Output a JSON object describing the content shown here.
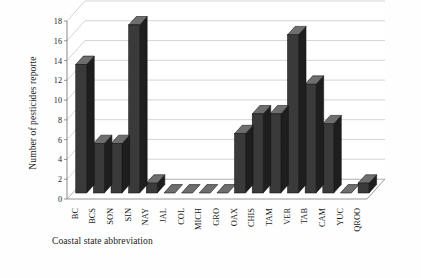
{
  "chart_data": {
    "type": "bar",
    "title": "",
    "subtitle": "",
    "xlabel": "Coastal state abbreviation",
    "ylabel": "Number of pesticides reporte",
    "categories": [
      "BC",
      "BCS",
      "SON",
      "SIN",
      "NAY",
      "JAL",
      "COL",
      "MICH",
      "GRO",
      "OAX",
      "CHIS",
      "TAM",
      "VER",
      "TAB",
      "CAM",
      "YUC",
      "QROO"
    ],
    "values": [
      13,
      5,
      5,
      17,
      1,
      0,
      0,
      0,
      0,
      6,
      8,
      8,
      16,
      11,
      7,
      0,
      1
    ],
    "ylim": [
      0,
      18
    ],
    "yticks": [
      0,
      2,
      4,
      6,
      8,
      10,
      12,
      14,
      16,
      18
    ],
    "ytick_labels": [
      "0",
      "2",
      "4",
      "6",
      "8",
      "10",
      "12",
      "14",
      "16",
      "18"
    ],
    "grid": true,
    "grid_axis": "y",
    "legend": false,
    "legend_position": "none",
    "projection": "3d",
    "bar_face_color": "#3a3a3a",
    "bar_side_color": "#1e1e1e",
    "bar_top_color": "#6e6e6e",
    "background_color": "#ffffff",
    "grid_color": "#b9b9b9",
    "axis_color": "#6b6b6b"
  }
}
